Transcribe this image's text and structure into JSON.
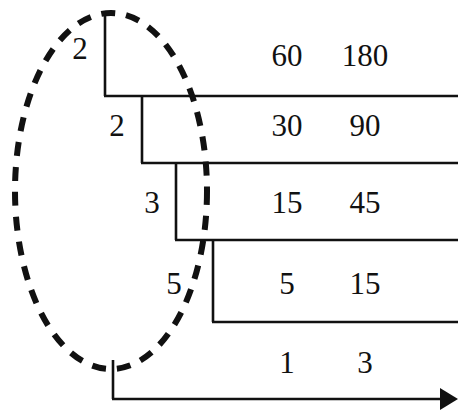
{
  "figure": {
    "type": "ladder-division-diagram",
    "ink_color": "#111111",
    "background_color": "#ffffff"
  },
  "highlight": {
    "shape": "dashed-ellipse",
    "encircles": "divisor-column",
    "center_x": 111,
    "center_y": 191,
    "radius_x": 96,
    "radius_y": 178,
    "dash": "14 11",
    "stroke_width": 6
  },
  "divisors": [
    {
      "value": "2",
      "x": 78,
      "y": 48
    },
    {
      "value": "2",
      "x": 115,
      "y": 125
    },
    {
      "value": "3",
      "x": 150,
      "y": 202
    },
    {
      "value": "5",
      "x": 172,
      "y": 283
    }
  ],
  "rows": [
    {
      "left": "60",
      "right": "180",
      "y": 55
    },
    {
      "left": "30",
      "right": "90",
      "y": 125
    },
    {
      "left": "15",
      "right": "45",
      "y": 202
    },
    {
      "left": "5",
      "right": "15",
      "y": 283
    },
    {
      "left": "1",
      "right": "3",
      "y": 362
    }
  ],
  "columns": {
    "left_x": 287,
    "right_x": 365
  },
  "ladder": {
    "stroke_width": 2.6,
    "steps": [
      {
        "v_x": 105,
        "v_y1": 15,
        "v_y2": 96,
        "h_y": 96,
        "h_x2": 458
      },
      {
        "v_x": 142,
        "v_y1": 96,
        "v_y2": 163,
        "h_y": 163,
        "h_x2": 458
      },
      {
        "v_x": 176,
        "v_y1": 163,
        "v_y2": 240,
        "h_y": 240,
        "h_x2": 458
      },
      {
        "v_x": 213,
        "v_y1": 240,
        "v_y2": 322,
        "h_y": 322,
        "h_x2": 458
      }
    ]
  },
  "axis_arrow": {
    "stem_x": 113,
    "stem_y1": 360,
    "stem_y2": 399,
    "line_x2": 441,
    "line_y": 399,
    "arrowhead": "solid-triangle-right"
  }
}
